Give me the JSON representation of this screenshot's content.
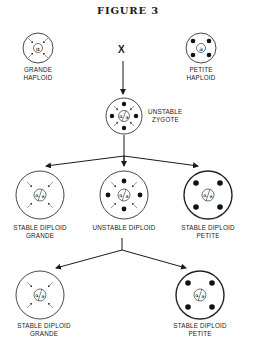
{
  "figure": {
    "title": "FIGURE 3",
    "cross_symbol": "X",
    "cells": [
      {
        "id": "grande-haploid",
        "label_line1": "GRANDE",
        "label_line2": "HAPLOID",
        "nucleus": "alpha",
        "markers": "arrows",
        "cx": 38,
        "cy": 48,
        "r": 15
      },
      {
        "id": "petite-haploid",
        "label_line1": "PETITE",
        "label_line2": "HAPLOID",
        "nucleus": "a",
        "markers": "dots",
        "cx": 201,
        "cy": 48,
        "r": 15
      },
      {
        "id": "unstable-zygote",
        "label_line1": "UNSTABLE",
        "label_line2": "ZYGOTE",
        "nucleus": "alpha/a",
        "markers": "arrows+dots",
        "cx": 124,
        "cy": 116,
        "r": 18
      },
      {
        "id": "stable-diploid-grande-1",
        "label_line1": "STABLE DIPLOID",
        "label_line2": "GRANDE",
        "nucleus": "alpha/a",
        "markers": "arrows",
        "cx": 40,
        "cy": 195,
        "r": 24
      },
      {
        "id": "unstable-diploid",
        "label_line1": "UNSTABLE DIPLOID",
        "label_line2": "",
        "nucleus": "alpha/a",
        "markers": "arrows+dots",
        "cx": 124,
        "cy": 195,
        "r": 24
      },
      {
        "id": "stable-diploid-petite-1",
        "label_line1": "STABLE DIPLOID",
        "label_line2": "PETITE",
        "nucleus": "alpha/a",
        "markers": "dots",
        "cx": 208,
        "cy": 195,
        "r": 24
      },
      {
        "id": "stable-diploid-grande-2",
        "label_line1": "STABLE DIPLOID",
        "label_line2": "GRANDE",
        "nucleus": "alpha/a",
        "markers": "arrows",
        "cx": 40,
        "cy": 295,
        "r": 24
      },
      {
        "id": "stable-diploid-petite-2",
        "label_line1": "STABLE DIPLOID",
        "label_line2": "PETITE",
        "nucleus": "alpha/a",
        "markers": "dots",
        "cx": 200,
        "cy": 295,
        "r": 24
      }
    ],
    "labels": {
      "grande_haploid": {
        "l1": "GRANDE",
        "l2": "HAPLOID"
      },
      "petite_haploid": {
        "l1": "PETITE",
        "l2": "HAPLOID"
      },
      "unstable_zygote": {
        "l1": "UNSTABLE",
        "l2": "ZYGOTE"
      },
      "sdg1": {
        "l1": "STABLE DIPLOID",
        "l2": "GRANDE"
      },
      "ud": {
        "l1": "UNSTABLE DIPLOID"
      },
      "sdp1": {
        "l1": "STABLE DIPLOID",
        "l2": "PETITE"
      },
      "sdg2": {
        "l1": "STABLE DIPLOID",
        "l2": "GRANDE"
      },
      "sdp2": {
        "l1": "STABLE DIPLOID",
        "l2": "PETITE"
      }
    },
    "nucleus_text": {
      "alpha": "α",
      "a": "a"
    }
  }
}
